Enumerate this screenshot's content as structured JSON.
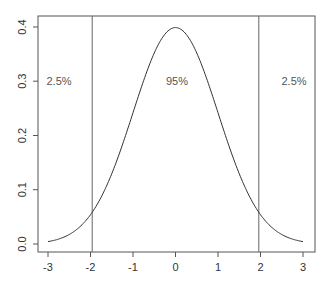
{
  "chart_data": {
    "type": "line",
    "title": "",
    "xlabel": "",
    "ylabel": "",
    "xlim": [
      -3,
      3
    ],
    "ylim": [
      0,
      0.4
    ],
    "grid": false,
    "legend": null,
    "series": [
      {
        "name": "Standard normal density",
        "x": [
          -3,
          -2.5,
          -2,
          -1.5,
          -1,
          -0.5,
          0,
          0.5,
          1,
          1.5,
          2,
          2.5,
          3
        ],
        "values": [
          0.0044,
          0.0175,
          0.054,
          0.1295,
          0.242,
          0.3521,
          0.3989,
          0.3521,
          0.242,
          0.1295,
          0.054,
          0.0175,
          0.0044
        ]
      }
    ],
    "vertical_lines": [
      -1.96,
      1.96
    ],
    "x_ticks": [
      "-3",
      "-2",
      "-1",
      "0",
      "1",
      "2",
      "3"
    ],
    "y_ticks": [
      "0.0",
      "0.1",
      "0.2",
      "0.3",
      "0.4"
    ],
    "annotations": [
      {
        "text": "2.5%",
        "x": -2.6,
        "y": 0.3
      },
      {
        "text": "95%",
        "x": 0,
        "y": 0.3
      },
      {
        "text": "2.5%",
        "x": 2.6,
        "y": 0.3
      }
    ]
  },
  "axes": {
    "x_ticks": [
      "-3",
      "-2",
      "-1",
      "0",
      "1",
      "2",
      "3"
    ],
    "y_ticks": [
      "0.0",
      "0.1",
      "0.2",
      "0.3",
      "0.4"
    ]
  },
  "annotations": {
    "left_tail": "2.5%",
    "center": "95%",
    "right_tail": "2.5%"
  },
  "colors": {
    "curve": "#333333",
    "axis": "#555555",
    "vline": "#666666",
    "text": "#555555"
  }
}
